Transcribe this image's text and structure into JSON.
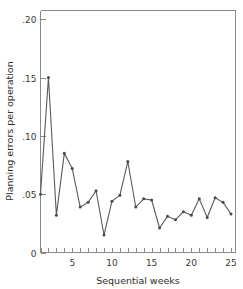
{
  "chart_data": {
    "type": "line",
    "title": "",
    "xlabel": "Sequential weeks",
    "ylabel": "Planning errors per operation",
    "x": [
      1,
      2,
      3,
      4,
      5,
      6,
      7,
      8,
      9,
      10,
      11,
      12,
      13,
      14,
      15,
      16,
      17,
      18,
      19,
      20,
      21,
      22,
      23,
      24,
      25
    ],
    "values": [
      0.05,
      0.15,
      0.032,
      0.085,
      0.072,
      0.039,
      0.043,
      0.053,
      0.015,
      0.044,
      0.049,
      0.078,
      0.039,
      0.046,
      0.045,
      0.021,
      0.031,
      0.028,
      0.035,
      0.032,
      0.046,
      0.03,
      0.047,
      0.043,
      0.033
    ],
    "xlim": [
      1,
      25
    ],
    "ylim": [
      0,
      0.2075
    ],
    "xticks": [
      1,
      2,
      3,
      4,
      5,
      6,
      7,
      8,
      9,
      10,
      11,
      12,
      13,
      14,
      15,
      16,
      17,
      18,
      19,
      20,
      21,
      22,
      23,
      24,
      25
    ],
    "xtick_labels": [
      {
        "value": 5,
        "label": "5"
      },
      {
        "value": 10,
        "label": "10"
      },
      {
        "value": 15,
        "label": "15"
      },
      {
        "value": 20,
        "label": "20"
      },
      {
        "value": 25,
        "label": "25"
      }
    ],
    "yticks": [
      0,
      0.05,
      0.1,
      0.15,
      0.2
    ],
    "ytick_labels": [
      "0",
      ".05",
      ".10",
      ".15",
      ".20"
    ],
    "grid": false,
    "legend": false,
    "line_color": "#5a5a5a",
    "marker_color": "#4a4a4a",
    "axis_color": "#8a8a8a",
    "background": "#ffffff"
  },
  "axes": {
    "x_title": "Sequential weeks",
    "y_title": "Planning errors per operation"
  }
}
